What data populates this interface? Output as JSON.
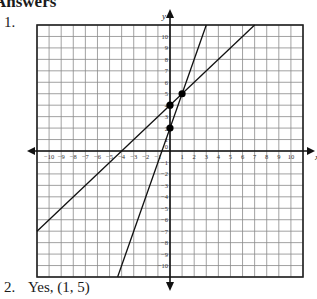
{
  "heading": "Answers",
  "problems": [
    {
      "number": "1.",
      "type": "graph"
    },
    {
      "number": "2.",
      "answer": "Yes, (1, 5)"
    }
  ],
  "chart_data": {
    "type": "line",
    "title": "",
    "xlabel": "x",
    "ylabel": "y",
    "xlim": [
      -11,
      11
    ],
    "ylim": [
      -11,
      11
    ],
    "grid": true,
    "x_ticks": [
      -10,
      -9,
      -8,
      -7,
      -6,
      -5,
      -4,
      -3,
      -2,
      -1,
      1,
      2,
      3,
      4,
      5,
      6,
      7,
      8,
      9,
      10
    ],
    "y_ticks": [
      10,
      9,
      8,
      7,
      6,
      5,
      4,
      3,
      2,
      1,
      -1,
      -2,
      -3,
      -4,
      -5,
      -6,
      -7,
      -8,
      -9,
      -10
    ],
    "origin_label": "0",
    "series": [
      {
        "name": "line 1",
        "equation": "y = x + 4",
        "slope": 1,
        "intercept": 4
      },
      {
        "name": "line 2",
        "equation": "y = 3x + 2",
        "slope": 3,
        "intercept": 2
      }
    ],
    "points": [
      {
        "x": 0,
        "y": 4
      },
      {
        "x": 0,
        "y": 2
      },
      {
        "x": 1,
        "y": 5
      }
    ]
  }
}
